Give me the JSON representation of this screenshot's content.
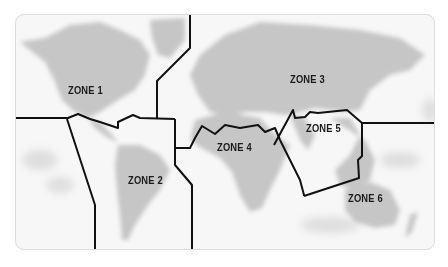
{
  "map": {
    "title": "World zone map",
    "colors": {
      "background": "#ffffff",
      "frame_border": "#dcdcdc",
      "ocean": "#f7f7f7",
      "land": "#c9c9c9",
      "land_shadow": "#b5b5b5",
      "boundary": "#111111",
      "label": "#1a1a1a"
    },
    "zones": [
      {
        "id": 1,
        "label": "ZONE 1",
        "region": "North America"
      },
      {
        "id": 2,
        "label": "ZONE 2",
        "region": "South America"
      },
      {
        "id": 3,
        "label": "ZONE 3",
        "region": "Europe and Northern Asia"
      },
      {
        "id": 4,
        "label": "ZONE 4",
        "region": "Africa and Middle East"
      },
      {
        "id": 5,
        "label": "ZONE 5",
        "region": "South and Southeast Asia"
      },
      {
        "id": 6,
        "label": "ZONE 6",
        "region": "Oceania"
      }
    ]
  }
}
